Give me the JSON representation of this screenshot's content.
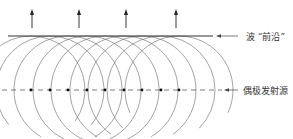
{
  "labels": {
    "wavefront": "波 “前沿”",
    "dipole_sources": "偶极发射源"
  },
  "diagram": {
    "arrows_x": [
      32,
      79,
      126,
      176
    ],
    "sources_x": [
      31,
      50,
      68,
      87,
      105,
      124,
      142,
      161,
      179
    ],
    "source_y": 90,
    "wavefront_y": 36,
    "radius": 54,
    "stroke_color": "#555555"
  }
}
